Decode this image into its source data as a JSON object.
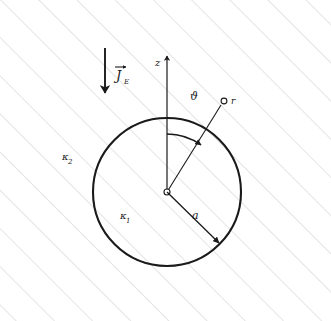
{
  "figure": {
    "width": 331,
    "height": 321,
    "background_color": "#ffffff",
    "hatch_color": "#c9c9c9",
    "stroke_color": "#1a1a1a"
  },
  "labels": {
    "current_density": "J",
    "current_density_subscript": "E",
    "z_axis": "z",
    "theta": "ϑ",
    "field_point": "r",
    "conductivity_outer": "κ",
    "conductivity_outer_subscript": "2",
    "conductivity_inner": "κ",
    "conductivity_inner_subscript": "1",
    "radius": "a"
  },
  "geometry": {
    "circle": {
      "cx": 167,
      "cy": 192,
      "r": 74
    },
    "origin_marker": {
      "cx": 167,
      "cy": 192,
      "r": 3
    },
    "field_point_marker": {
      "cx": 224,
      "cy": 101,
      "r": 3
    },
    "z_axis": {
      "x": 167,
      "y_top": 52,
      "y_bottom": 192
    },
    "current_arrow": {
      "x": 105,
      "y_top": 48,
      "y_bottom": 96
    },
    "radius_arrow": {
      "x1": 167,
      "y1": 192,
      "x2": 222,
      "y2": 246
    },
    "r_line": {
      "x1": 167,
      "y1": 192,
      "x2": 221,
      "y2": 104
    },
    "theta_arc_radius": 58,
    "hatch_angle_deg": 45,
    "hatch_spacing_px": 38
  }
}
